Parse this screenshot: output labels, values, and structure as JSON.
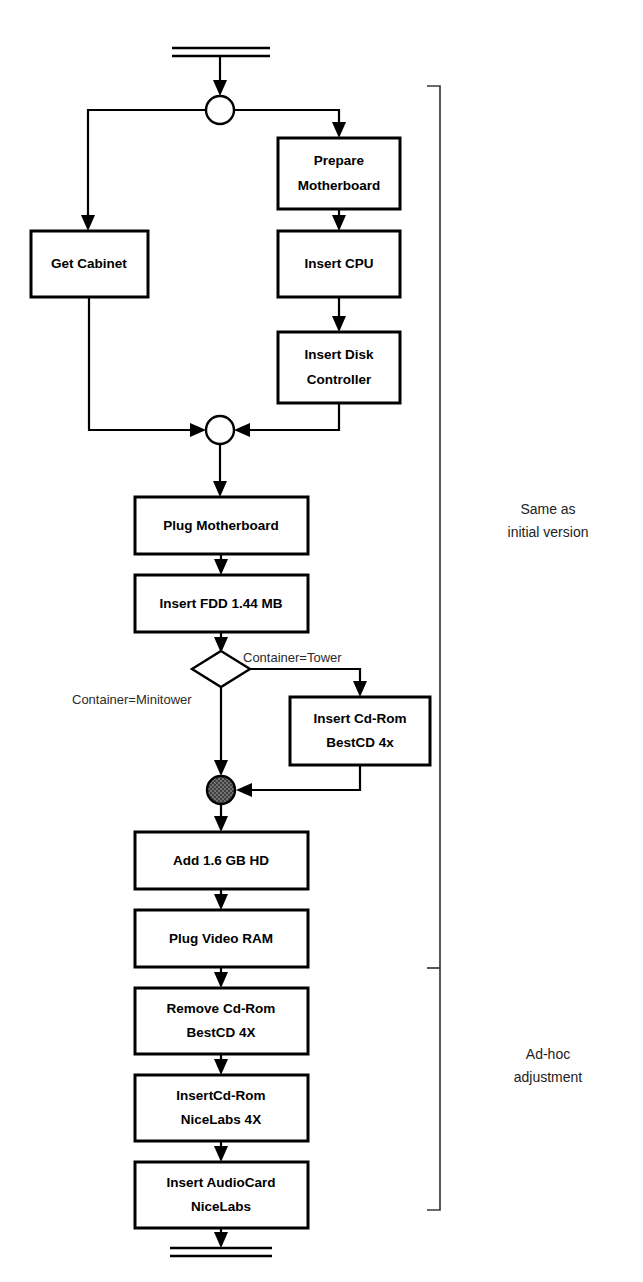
{
  "diagram": {
    "type": "activity-flowchart",
    "start_marker": "double-bar-terminal",
    "end_marker": "double-bar-terminal",
    "nodes": {
      "prepare_motherboard": {
        "line1": "Prepare",
        "line2": "Motherboard"
      },
      "get_cabinet": {
        "line1": "Get Cabinet",
        "line2": ""
      },
      "insert_cpu": {
        "line1": "Insert CPU",
        "line2": ""
      },
      "insert_disk_controller": {
        "line1": "Insert Disk",
        "line2": "Controller"
      },
      "plug_motherboard": {
        "line1": "Plug Motherboard",
        "line2": ""
      },
      "insert_fdd": {
        "line1": "Insert FDD 1.44 MB",
        "line2": ""
      },
      "insert_cdrom_bestcd": {
        "line1": "Insert Cd-Rom",
        "line2": "BestCD 4x"
      },
      "add_hd": {
        "line1": "Add 1.6 GB HD",
        "line2": ""
      },
      "plug_video_ram": {
        "line1": "Plug Video RAM",
        "line2": ""
      },
      "remove_cdrom_bestcd": {
        "line1": "Remove Cd-Rom",
        "line2": "BestCD 4X"
      },
      "insert_cdrom_nicelabs": {
        "line1": "InsertCd-Rom",
        "line2": "NiceLabs 4X"
      },
      "insert_audiocard": {
        "line1": "Insert AudioCard",
        "line2": "NiceLabs"
      }
    },
    "guards": {
      "tower": "Container=Tower",
      "minitower": "Container=Minitower"
    },
    "annotations": {
      "upper": {
        "line1": "Same as",
        "line2": "initial version"
      },
      "lower": {
        "line1": "Ad-hoc",
        "line2": "adjustment"
      }
    },
    "colors": {
      "stroke": "#000000",
      "fill": "#ffffff",
      "merge_fill": "#4a4a4a",
      "bracket": "#3a3a3a",
      "annotation_text": "#222222"
    }
  }
}
